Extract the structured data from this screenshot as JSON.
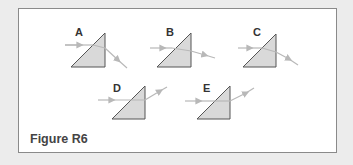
{
  "figure": {
    "caption": "Figure R6",
    "colors": {
      "background": "#ececec",
      "panel": "#ffffff",
      "border": "#8a8a8a",
      "prism_fill": "#d9d9d9",
      "prism_stroke": "#555555",
      "ray": "#b8b8b8"
    }
  },
  "prisms": [
    {
      "label": "A",
      "exit_direction": "downward-steep"
    },
    {
      "label": "B",
      "exit_direction": "downward-slight"
    },
    {
      "label": "C",
      "exit_direction": "downward-moderate"
    },
    {
      "label": "D",
      "exit_direction": "upward"
    },
    {
      "label": "E",
      "exit_direction": "upward"
    }
  ]
}
